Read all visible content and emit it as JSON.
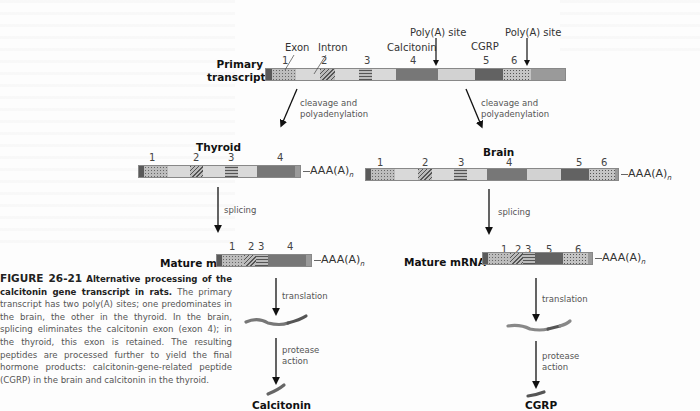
{
  "figure": {
    "number": "FIGURE 26-21",
    "title": "Alternative processing of the calcitonin gene transcript in rats.",
    "caption": "The primary transcript has two poly(A) sites; one predominates in the brain, the other in the thyroid. In the brain, splicing eliminates the calcitonin exon (exon 4); in the thyroid, this exon is retained. The resulting peptides are processed further to yield the final hormone products: calcitonin-gene-related peptide (CGRP) in the brain and calcitonin in the thyroid."
  },
  "colors": {
    "exon_dark": "#6f6f6f",
    "exon_light": "#d4d4d4",
    "intron": "#d9d9d9",
    "cap": "#555555",
    "arrow": "#111111"
  },
  "primary": {
    "label_line1": "Primary",
    "label_line2": "transcript",
    "exon_label": "Exon",
    "intron_label": "Intron",
    "calcitonin_label": "Calcitonin",
    "cgrp_label": "CGRP",
    "polya_site_1": "Poly(A) site",
    "polya_site_2": "Poly(A) site",
    "exon_numbers": [
      "1",
      "2",
      "3",
      "4",
      "5",
      "6"
    ]
  },
  "steps": {
    "cleavage_left": "cleavage and",
    "cleavage_left_2": "polyadenylation",
    "cleavage_right": "cleavage and",
    "cleavage_right_2": "polyadenylation",
    "splicing_left": "splicing",
    "splicing_right": "splicing",
    "translation_left": "translation",
    "translation_right": "translation",
    "protease_left_1": "protease",
    "protease_left_2": "action",
    "protease_right_1": "protease",
    "protease_right_2": "action"
  },
  "thyroid": {
    "title": "Thyroid",
    "exon_numbers": [
      "1",
      "2",
      "3",
      "4"
    ],
    "tail": "AAA(A)",
    "tail_sub": "n",
    "mature_label": "Mature mRNA",
    "mature_numbers": [
      "1",
      "2",
      "3",
      "4"
    ],
    "product": "Calcitonin"
  },
  "brain": {
    "title": "Brain",
    "exon_numbers": [
      "1",
      "2",
      "3",
      "4",
      "5",
      "6"
    ],
    "tail": "AAA(A)",
    "tail_sub": "n",
    "mature_label": "Mature mRNA",
    "mature_numbers": [
      "1",
      "2",
      "3",
      "5",
      "6"
    ],
    "product": "CGRP"
  }
}
